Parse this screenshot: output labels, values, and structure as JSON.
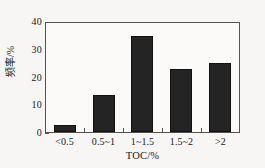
{
  "chart_data": {
    "type": "bar",
    "title": "",
    "subtitle": "",
    "xlabel": "TOC/%",
    "ylabel": "频率/%",
    "categories": [
      "<0.5",
      "0.5~1",
      "1~1.5",
      "1.5~2",
      ">2"
    ],
    "values": [
      2.7,
      13.7,
      35.2,
      23.1,
      25.2
    ],
    "series": [
      {
        "name": "频率",
        "values": [
          2.7,
          13.7,
          35.2,
          23.1,
          25.2
        ]
      }
    ],
    "ylim": [
      0,
      40
    ],
    "ytick_labels": [
      "0",
      "10",
      "20",
      "30",
      "40"
    ],
    "ytick_values": [
      0,
      10,
      20,
      30,
      40
    ],
    "xtick_labels": [
      "<0.5",
      "0.5~1",
      "1~1.5",
      "1.5~2",
      ">2"
    ],
    "grid": false,
    "legend": false,
    "legend_position": "none",
    "annotations": [],
    "colors": {
      "bar_fill": "#242424",
      "bar_edge": "#111111",
      "axis": "#55524f",
      "plot_background": "#fbfaf9",
      "figure_background": "#f7f6f4",
      "text": "#1a1a1a"
    }
  }
}
